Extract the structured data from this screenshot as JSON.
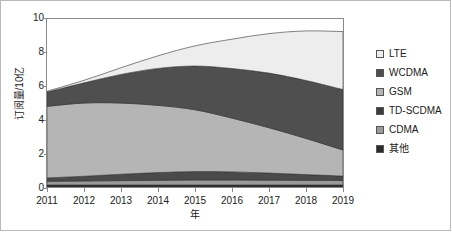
{
  "chart_data": {
    "type": "area",
    "stacked": true,
    "title": "",
    "xlabel": "年",
    "ylabel": "订阅量/10亿",
    "x": [
      2011,
      2012,
      2013,
      2014,
      2015,
      2016,
      2017,
      2018,
      2019
    ],
    "categories": [
      "2011",
      "2012",
      "2013",
      "2014",
      "2015",
      "2016",
      "2017",
      "2018",
      "2019"
    ],
    "xlim": [
      2011,
      2019
    ],
    "ylim": [
      0,
      10
    ],
    "yticks": [
      0,
      2,
      4,
      6,
      8,
      10
    ],
    "ytick_labels": [
      "0",
      "2",
      "4",
      "6",
      "8",
      "10"
    ],
    "grid": false,
    "legend_position": "right",
    "stack_order_bottom_to_top": [
      "其他",
      "CDMA",
      "TD-SCDMA",
      "GSM",
      "WCDMA",
      "LTE"
    ],
    "series": [
      {
        "name": "其他",
        "color": "#2b2b2b",
        "values": [
          0.12,
          0.12,
          0.12,
          0.12,
          0.12,
          0.12,
          0.12,
          0.12,
          0.12
        ]
      },
      {
        "name": "CDMA",
        "color": "#9a9a9a",
        "values": [
          0.22,
          0.24,
          0.26,
          0.28,
          0.3,
          0.3,
          0.29,
          0.28,
          0.27
        ]
      },
      {
        "name": "TD-SCDMA",
        "color": "#4a4a4a",
        "values": [
          0.2,
          0.28,
          0.38,
          0.46,
          0.5,
          0.48,
          0.42,
          0.34,
          0.26
        ]
      },
      {
        "name": "GSM",
        "color": "#b5b5b5",
        "values": [
          4.26,
          4.36,
          4.24,
          4.0,
          3.68,
          3.2,
          2.7,
          2.15,
          1.55
        ]
      },
      {
        "name": "WCDMA",
        "color": "#4f4f4f",
        "values": [
          0.85,
          1.2,
          1.7,
          2.2,
          2.6,
          2.95,
          3.25,
          3.45,
          3.6
        ]
      },
      {
        "name": "LTE",
        "color": "#ededed",
        "values": [
          0.05,
          0.15,
          0.4,
          0.75,
          1.2,
          1.75,
          2.35,
          2.95,
          3.45
        ]
      }
    ],
    "stack_tops": {
      "其他": [
        0.12,
        0.12,
        0.12,
        0.12,
        0.12,
        0.12,
        0.12,
        0.12,
        0.12
      ],
      "CDMA": [
        0.34,
        0.36,
        0.38,
        0.4,
        0.42,
        0.42,
        0.41,
        0.4,
        0.39
      ],
      "TD-SCDMA": [
        0.54,
        0.64,
        0.76,
        0.86,
        0.92,
        0.9,
        0.83,
        0.74,
        0.65
      ],
      "GSM": [
        4.8,
        5.0,
        5.0,
        4.86,
        4.6,
        4.1,
        3.53,
        2.89,
        2.2
      ],
      "WCDMA": [
        5.65,
        6.2,
        6.7,
        7.06,
        7.2,
        7.05,
        6.78,
        6.34,
        5.8
      ],
      "LTE": [
        5.7,
        6.35,
        7.1,
        7.81,
        8.4,
        8.8,
        9.13,
        9.29,
        9.25
      ]
    },
    "totals": [
      5.7,
      6.35,
      7.1,
      7.81,
      8.4,
      8.8,
      9.13,
      9.29,
      9.25
    ]
  },
  "axes": {
    "x_title": "年",
    "y_title": "订阅量/10亿",
    "y_tick_labels": [
      "10",
      "8",
      "6",
      "4",
      "2",
      "0"
    ],
    "x_tick_labels": [
      "2011",
      "2012",
      "2013",
      "2014",
      "2015",
      "2016",
      "2017",
      "2018",
      "2019"
    ]
  },
  "legend": {
    "items": [
      {
        "label": "LTE",
        "color": "#ededed"
      },
      {
        "label": "WCDMA",
        "color": "#4f4f4f"
      },
      {
        "label": "GSM",
        "color": "#b5b5b5"
      },
      {
        "label": "TD-SCDMA",
        "color": "#3c3c3c"
      },
      {
        "label": "CDMA",
        "color": "#9a9a9a"
      },
      {
        "label": "其他",
        "color": "#2b2b2b"
      }
    ]
  }
}
